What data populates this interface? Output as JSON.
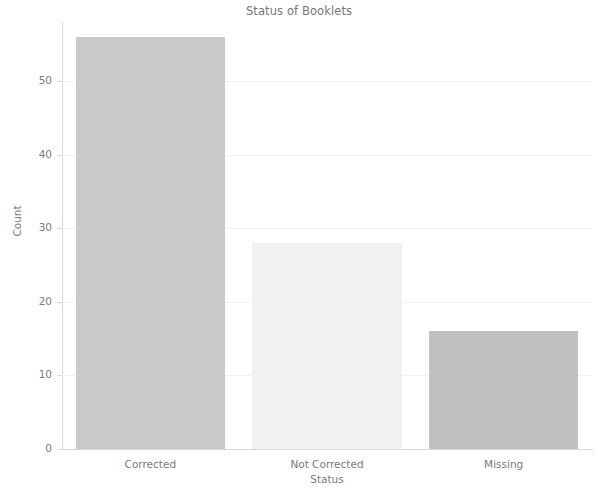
{
  "chart_data": {
    "type": "bar",
    "title": "Status of Booklets",
    "xlabel": "Status",
    "ylabel": "Count",
    "categories": [
      "Corrected",
      "Not Corrected",
      "Missing"
    ],
    "values": [
      56,
      28,
      16
    ],
    "ylim": [
      0,
      58
    ],
    "yticks": [
      0,
      10,
      20,
      30,
      40,
      50
    ],
    "ytick_labels": [
      "0",
      "10",
      "20",
      "30",
      "40",
      "50"
    ],
    "grid": true,
    "grid_axis": "y",
    "legend": null,
    "bar_colors": [
      "#c9c9c9",
      "#f1f1f1",
      "#c0c0c0"
    ],
    "background_color": "#ffffff",
    "text_color": "#7a7a7a",
    "gridline_color": "#f2f2f2",
    "axis_color": "#d8d8d8"
  }
}
